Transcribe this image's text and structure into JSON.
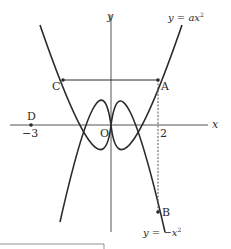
{
  "diagram": {
    "axes": {
      "x_label": "x",
      "y_label": "y",
      "origin_label": "O"
    },
    "curves": [
      {
        "name": "upper",
        "label": "y = ax²",
        "label_parts": [
          "y",
          " = ",
          "ax",
          "2"
        ]
      },
      {
        "name": "lower",
        "label": "y = −x²",
        "label_parts": [
          "y",
          " = −",
          "x",
          "2"
        ]
      }
    ],
    "points": [
      {
        "name": "A",
        "label": "A"
      },
      {
        "name": "B",
        "label": "B"
      },
      {
        "name": "C",
        "label": "C"
      },
      {
        "name": "D",
        "label": "D"
      }
    ],
    "ticks": {
      "x_pos": "2",
      "x_neg": "−3"
    },
    "colors": {
      "line": "#2a2a2a",
      "axis": "#555555"
    }
  }
}
